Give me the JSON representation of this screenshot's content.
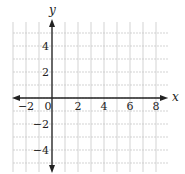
{
  "chart_data": {
    "type": "coordinate-grid",
    "title": "",
    "xlabel": "x",
    "ylabel": "y",
    "xlim": [
      -3,
      8.9
    ],
    "ylim": [
      -5.5,
      5.9
    ],
    "grid": true,
    "x_grid_units": [
      -3,
      -2,
      -1,
      0,
      1,
      2,
      3,
      4,
      5,
      6,
      7,
      8
    ],
    "y_grid_units": [
      -5,
      -4,
      -3,
      -2,
      -1,
      0,
      1,
      2,
      3,
      4,
      5
    ],
    "x_tick_labels": [
      {
        "value": -2,
        "label": "−2"
      },
      {
        "value": 0,
        "label": "0"
      },
      {
        "value": 2,
        "label": "2"
      },
      {
        "value": 4,
        "label": "4"
      },
      {
        "value": 6,
        "label": "6"
      },
      {
        "value": 8,
        "label": "8"
      }
    ],
    "y_tick_labels": [
      {
        "value": 4,
        "label": "4"
      },
      {
        "value": 2,
        "label": "2"
      },
      {
        "value": -2,
        "label": "−2"
      },
      {
        "value": -4,
        "label": "−4"
      }
    ],
    "series": []
  },
  "layout": {
    "origin_px": [
      52,
      98
    ],
    "unit_px": 13,
    "grid_color": "#c8c8c8",
    "axis_color": "#222222"
  },
  "labels": {
    "x_axis": "x",
    "y_axis": "y",
    "origin": "0"
  }
}
